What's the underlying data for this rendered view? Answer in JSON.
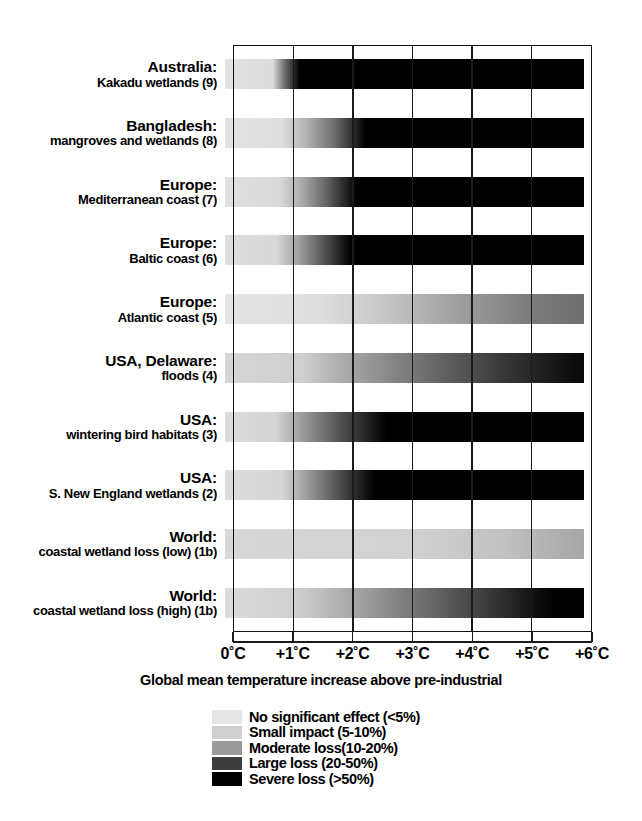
{
  "chart_data": {
    "type": "heatmap",
    "title": "",
    "xlabel": "Global mean temperature increase above pre-industrial",
    "ylabel": "",
    "xlim": [
      0,
      6
    ],
    "x_tick_labels": [
      "0˚C",
      "+1˚C",
      "+2˚C",
      "+3˚C",
      "+4˚C",
      "+5˚C",
      "+6˚C"
    ],
    "x_tick_values": [
      0,
      1,
      2,
      3,
      4,
      5,
      6
    ],
    "grid": true,
    "legend_position": "below-axis-center",
    "value_scale": "grey shading: light = no significant effect, black = severe loss",
    "categories": [
      "Australia: Kakadu wetlands (9)",
      "Bangladesh: mangroves and wetlands (8)",
      "Europe: Mediterranean coast (7)",
      "Europe: Baltic coast (6)",
      "Europe: Atlantic coast (5)",
      "USA, Delaware: floods (4)",
      "USA: wintering bird habitats (3)",
      "USA: S. New England wetlands (2)",
      "World: coastal wetland loss (low) (1b)",
      "World: coastal wetland loss (high) (1b)"
    ],
    "series": [
      {
        "name": "Australia: Kakadu wetlands (9)",
        "stops": [
          {
            "x": 0.0,
            "shade": "#e2e2e2"
          },
          {
            "x": 0.8,
            "shade": "#dcdcdc"
          },
          {
            "x": 1.0,
            "shade": "#6e6e6e"
          },
          {
            "x": 1.25,
            "shade": "#000000"
          },
          {
            "x": 6.0,
            "shade": "#000000"
          }
        ]
      },
      {
        "name": "Bangladesh: mangroves and wetlands (8)",
        "stops": [
          {
            "x": 0.0,
            "shade": "#e3e3e3"
          },
          {
            "x": 0.95,
            "shade": "#dedede"
          },
          {
            "x": 1.35,
            "shade": "#b4b4b4"
          },
          {
            "x": 1.85,
            "shade": "#6a6a6a"
          },
          {
            "x": 2.35,
            "shade": "#000000"
          },
          {
            "x": 6.0,
            "shade": "#000000"
          }
        ]
      },
      {
        "name": "Europe: Mediterranean coast (7)",
        "stops": [
          {
            "x": 0.0,
            "shade": "#e0e0e0"
          },
          {
            "x": 0.9,
            "shade": "#dadada"
          },
          {
            "x": 1.3,
            "shade": "#a8a8a8"
          },
          {
            "x": 1.75,
            "shade": "#5a5a5a"
          },
          {
            "x": 2.2,
            "shade": "#000000"
          },
          {
            "x": 6.0,
            "shade": "#000000"
          }
        ]
      },
      {
        "name": "Europe: Baltic coast (6)",
        "stops": [
          {
            "x": 0.0,
            "shade": "#dedede"
          },
          {
            "x": 0.85,
            "shade": "#d8d8d8"
          },
          {
            "x": 1.25,
            "shade": "#9e9e9e"
          },
          {
            "x": 1.7,
            "shade": "#4c4c4c"
          },
          {
            "x": 2.1,
            "shade": "#000000"
          },
          {
            "x": 6.0,
            "shade": "#000000"
          }
        ]
      },
      {
        "name": "Europe: Atlantic coast (5)",
        "stops": [
          {
            "x": 0.0,
            "shade": "#e4e4e4"
          },
          {
            "x": 1.6,
            "shade": "#dedede"
          },
          {
            "x": 2.6,
            "shade": "#c8c8c8"
          },
          {
            "x": 3.8,
            "shade": "#a2a2a2"
          },
          {
            "x": 5.0,
            "shade": "#7e7e7e"
          },
          {
            "x": 6.0,
            "shade": "#6e6e6e"
          }
        ]
      },
      {
        "name": "USA, Delaware: floods (4)",
        "stops": [
          {
            "x": 0.0,
            "shade": "#d6d6d6"
          },
          {
            "x": 1.3,
            "shade": "#cfcfcf"
          },
          {
            "x": 2.2,
            "shade": "#a0a0a0"
          },
          {
            "x": 3.4,
            "shade": "#6c6c6c"
          },
          {
            "x": 4.6,
            "shade": "#3a3a3a"
          },
          {
            "x": 5.6,
            "shade": "#141414"
          },
          {
            "x": 6.0,
            "shade": "#0a0a0a"
          }
        ]
      },
      {
        "name": "USA: wintering bird habitats (3)",
        "stops": [
          {
            "x": 0.0,
            "shade": "#dcdcdc"
          },
          {
            "x": 0.85,
            "shade": "#d4d4d4"
          },
          {
            "x": 1.4,
            "shade": "#8e8e8e"
          },
          {
            "x": 2.0,
            "shade": "#4a4a4a"
          },
          {
            "x": 2.7,
            "shade": "#000000"
          },
          {
            "x": 6.0,
            "shade": "#000000"
          }
        ]
      },
      {
        "name": "USA: S. New England wetlands (2)",
        "stops": [
          {
            "x": 0.0,
            "shade": "#dddddd"
          },
          {
            "x": 0.95,
            "shade": "#d6d6d6"
          },
          {
            "x": 1.5,
            "shade": "#8a8a8a"
          },
          {
            "x": 2.0,
            "shade": "#424242"
          },
          {
            "x": 2.5,
            "shade": "#000000"
          },
          {
            "x": 6.0,
            "shade": "#000000"
          }
        ]
      },
      {
        "name": "World: coastal wetland loss (low) (1b)",
        "stops": [
          {
            "x": 0.0,
            "shade": "#d8d8d8"
          },
          {
            "x": 3.0,
            "shade": "#d2d2d2"
          },
          {
            "x": 4.6,
            "shade": "#c2c2c2"
          },
          {
            "x": 6.0,
            "shade": "#a6a6a6"
          }
        ]
      },
      {
        "name": "World: coastal wetland loss (high) (1b)",
        "stops": [
          {
            "x": 0.0,
            "shade": "#dcdcdc"
          },
          {
            "x": 1.2,
            "shade": "#cfcfcf"
          },
          {
            "x": 2.2,
            "shade": "#a4a4a4"
          },
          {
            "x": 3.4,
            "shade": "#6a6a6a"
          },
          {
            "x": 4.6,
            "shade": "#303030"
          },
          {
            "x": 5.5,
            "shade": "#000000"
          },
          {
            "x": 6.0,
            "shade": "#000000"
          }
        ]
      }
    ],
    "legend": [
      {
        "label": "No significant effect (<5%)",
        "color": "#e6e6e6"
      },
      {
        "label": "Small impact (5-10%)",
        "color": "#cfcfcf"
      },
      {
        "label": "Moderate loss(10-20%)",
        "color": "#9a9a9a"
      },
      {
        "label": "Large loss (20-50%)",
        "color": "#3d3d3d"
      },
      {
        "label": "Severe loss (>50%)",
        "color": "#000000"
      }
    ]
  },
  "rows": [
    {
      "line1": "Australia:",
      "line2": "Kakadu wetlands (9)"
    },
    {
      "line1": "Bangladesh:",
      "line2": "mangroves and wetlands (8)"
    },
    {
      "line1": "Europe:",
      "line2": "Mediterranean coast (7)"
    },
    {
      "line1": "Europe:",
      "line2": "Baltic coast (6)"
    },
    {
      "line1": "Europe:",
      "line2": "Atlantic coast (5)"
    },
    {
      "line1": "USA, Delaware:",
      "line2": "floods (4)"
    },
    {
      "line1": "USA:",
      "line2": "wintering bird habitats (3)"
    },
    {
      "line1": "USA:",
      "line2": "S. New England wetlands (2)"
    },
    {
      "line1": "World:",
      "line2": "coastal wetland loss (low) (1b)"
    },
    {
      "line1": "World:",
      "line2": "coastal wetland loss (high) (1b)"
    }
  ],
  "axis": {
    "title": "Global mean temperature increase above pre-industrial"
  }
}
